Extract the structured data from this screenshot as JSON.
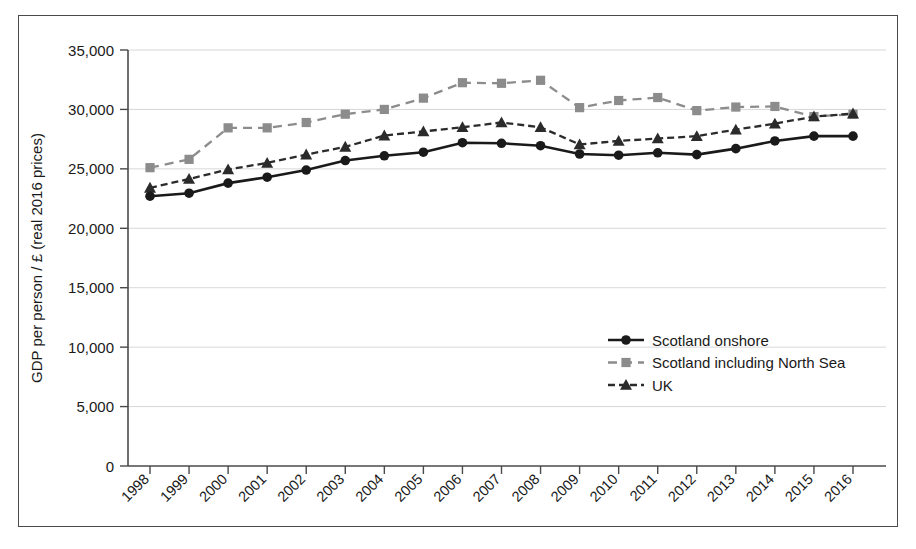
{
  "chart_data": {
    "type": "line",
    "title": "",
    "xlabel": "",
    "ylabel": "GDP per person / £ (real 2016 prices)",
    "ylim": [
      0,
      35000
    ],
    "yticks": [
      0,
      5000,
      10000,
      15000,
      20000,
      25000,
      30000,
      35000
    ],
    "ytick_labels": [
      "0",
      "5,000",
      "10,000",
      "15,000",
      "20,000",
      "25,000",
      "30,000",
      "35,000"
    ],
    "grid": true,
    "grid_axis": "y",
    "legend_position": "center-right",
    "categories": [
      1998,
      1999,
      2000,
      2001,
      2002,
      2003,
      2004,
      2005,
      2006,
      2007,
      2008,
      2009,
      2010,
      2011,
      2012,
      2013,
      2014,
      2015,
      2016
    ],
    "xtick_labels": [
      "1998",
      "1999",
      "2000",
      "2001",
      "2002",
      "2003",
      "2004",
      "2005",
      "2006",
      "2007",
      "2008",
      "2009",
      "2010",
      "2011",
      "2012",
      "2013",
      "2014",
      "2015",
      "2016"
    ],
    "series": [
      {
        "name": "Scotland onshore",
        "color": "#1a1a1a",
        "marker": "circle",
        "line_style": "solid",
        "values": [
          22700,
          22950,
          23800,
          24300,
          24900,
          25700,
          26100,
          26400,
          27200,
          27150,
          26950,
          26250,
          26150,
          26350,
          26200,
          26700,
          27350,
          27750,
          27750
        ]
      },
      {
        "name": "Scotland including North Sea",
        "color": "#8c8c8c",
        "marker": "square",
        "line_style": "dashed",
        "values": [
          25100,
          25800,
          28450,
          28450,
          28900,
          29600,
          30000,
          30950,
          32250,
          32200,
          32450,
          30150,
          30750,
          31000,
          29900,
          30200,
          30250,
          29400,
          29600
        ]
      },
      {
        "name": "UK",
        "color": "#2b2b2b",
        "marker": "triangle",
        "line_style": "dashed",
        "values": [
          23400,
          24150,
          24950,
          25500,
          26200,
          26850,
          27800,
          28150,
          28500,
          28900,
          28500,
          27050,
          27350,
          27550,
          27750,
          28300,
          28800,
          29400,
          29650
        ]
      }
    ]
  },
  "legend": {
    "items": [
      {
        "label": "Scotland onshore"
      },
      {
        "label": "Scotland including North Sea"
      },
      {
        "label": "UK"
      }
    ]
  }
}
